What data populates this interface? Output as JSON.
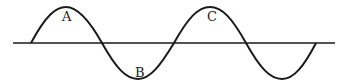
{
  "diagram": {
    "type": "sine-wave",
    "labels": [
      {
        "text": "A",
        "x": 67,
        "y": 21
      },
      {
        "text": "B",
        "x": 139,
        "y": 77
      },
      {
        "text": "C",
        "x": 211,
        "y": 21
      }
    ],
    "colors": {
      "stroke": "#1a1a1a",
      "background": "#ffffff"
    }
  }
}
